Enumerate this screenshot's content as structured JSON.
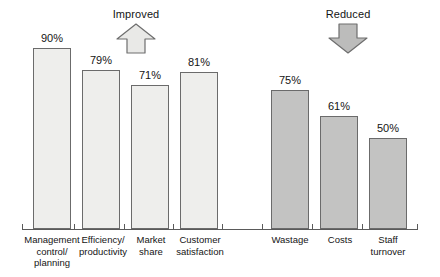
{
  "chart_data": {
    "type": "bar",
    "title": "",
    "subtitle": "",
    "xlabel": "",
    "ylabel": "",
    "ylim": [
      0,
      100
    ],
    "grid": false,
    "legend": "none",
    "value_suffix": "%",
    "groups": [
      {
        "name": "Improved",
        "direction": "up",
        "bar_style": "light",
        "categories": [
          "Management control/ planning",
          "Efficiency/ productivity",
          "Market share",
          "Customer satisfaction"
        ],
        "values": [
          90,
          79,
          71,
          81
        ]
      },
      {
        "name": "Reduced",
        "direction": "down",
        "bar_style": "dark",
        "categories": [
          "Wastage",
          "Costs",
          "Staff turnover"
        ],
        "values": [
          75,
          61,
          50
        ]
      }
    ],
    "categories": [
      "Management control/ planning",
      "Efficiency/ productivity",
      "Market share",
      "Customer satisfaction",
      "Wastage",
      "Costs",
      "Staff turnover"
    ],
    "values": [
      90,
      79,
      71,
      81,
      75,
      61,
      50
    ]
  },
  "annotations": {
    "improved": {
      "label": "Improved",
      "arrow": "arrow-up-icon"
    },
    "reduced": {
      "label": "Reduced",
      "arrow": "arrow-down-icon"
    }
  },
  "bars": [
    {
      "label_line1": "Management",
      "label_line2": "control/",
      "label_line3": "planning",
      "value_text": "90%",
      "value": 90,
      "style": "light"
    },
    {
      "label_line1": "Efficiency/",
      "label_line2": "productivity",
      "label_line3": "",
      "value_text": "79%",
      "value": 79,
      "style": "light"
    },
    {
      "label_line1": "Market",
      "label_line2": "share",
      "label_line3": "",
      "value_text": "71%",
      "value": 71,
      "style": "light"
    },
    {
      "label_line1": "Customer",
      "label_line2": "satisfaction",
      "label_line3": "",
      "value_text": "81%",
      "value": 81,
      "style": "light"
    },
    {
      "label_line1": "Wastage",
      "label_line2": "",
      "label_line3": "",
      "value_text": "75%",
      "value": 75,
      "style": "dark"
    },
    {
      "label_line1": "Costs",
      "label_line2": "",
      "label_line3": "",
      "value_text": "61%",
      "value": 61,
      "style": "dark"
    },
    {
      "label_line1": "Staff",
      "label_line2": "turnover",
      "label_line3": "",
      "value_text": "50%",
      "value": 50,
      "style": "dark"
    }
  ],
  "colors": {
    "bar_light_fill": "#eeeeec",
    "bar_dark_fill": "#c3c3c2",
    "bar_stroke": "#6b6b6b",
    "axis": "#5a5a5a",
    "text": "#141414",
    "background": "#ffffff",
    "arrow_up_fill": "#e9e9e7",
    "arrow_down_fill": "#bcbcbb",
    "arrow_stroke": "#6e6e6e"
  },
  "layout": {
    "bar_geometry": [
      {
        "x": 33,
        "width": 38,
        "top": 48,
        "bottom": 229
      },
      {
        "x": 82,
        "width": 38,
        "top": 70,
        "bottom": 229
      },
      {
        "x": 131,
        "width": 38,
        "top": 85,
        "bottom": 229
      },
      {
        "x": 180,
        "width": 38,
        "top": 72,
        "bottom": 229
      },
      {
        "x": 271,
        "width": 38,
        "top": 90,
        "bottom": 229
      },
      {
        "x": 320,
        "width": 38,
        "top": 116,
        "bottom": 229
      },
      {
        "x": 369,
        "width": 38,
        "top": 138,
        "bottom": 229
      }
    ],
    "tick_positions": [
      22,
      74,
      124,
      173,
      222,
      262,
      312,
      362,
      417
    ],
    "label_slots": [
      {
        "x": 20,
        "width": 64
      },
      {
        "x": 71,
        "width": 64
      },
      {
        "x": 120,
        "width": 62
      },
      {
        "x": 167,
        "width": 66
      },
      {
        "x": 258,
        "width": 64
      },
      {
        "x": 309,
        "width": 62
      },
      {
        "x": 356,
        "width": 64
      }
    ]
  }
}
